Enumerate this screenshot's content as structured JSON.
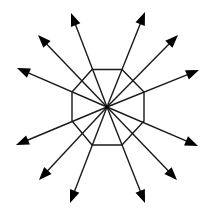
{
  "diagram": {
    "type": "radial-arrows",
    "center": {
      "x": 107,
      "y": 107
    },
    "stroke_color": "#1a1a1a",
    "background": "#ffffff",
    "octagon": {
      "points": [
        [
          92,
          69.5
        ],
        [
          122,
          69.5
        ],
        [
          144,
          92
        ],
        [
          144,
          121
        ],
        [
          122,
          145
        ],
        [
          92,
          145
        ],
        [
          72,
          121
        ],
        [
          72,
          92
        ]
      ]
    },
    "arrows": [
      {
        "id": "arrow-1",
        "tip": [
          145,
          12
        ]
      },
      {
        "id": "arrow-2",
        "tip": [
          178,
          35
        ]
      },
      {
        "id": "arrow-3",
        "tip": [
          199,
          70
        ]
      },
      {
        "id": "arrow-4",
        "tip": [
          198,
          146
        ]
      },
      {
        "id": "arrow-5",
        "tip": [
          177,
          180
        ]
      },
      {
        "id": "arrow-6",
        "tip": [
          145,
          203
        ]
      },
      {
        "id": "arrow-7",
        "tip": [
          70,
          203
        ]
      },
      {
        "id": "arrow-8",
        "tip": [
          39,
          180
        ]
      },
      {
        "id": "arrow-9",
        "tip": [
          16,
          145
        ]
      },
      {
        "id": "arrow-10",
        "tip": [
          17,
          68
        ]
      },
      {
        "id": "arrow-11",
        "tip": [
          38,
          35
        ]
      },
      {
        "id": "arrow-12",
        "tip": [
          71,
          13
        ]
      }
    ],
    "arrow_count": 12
  }
}
